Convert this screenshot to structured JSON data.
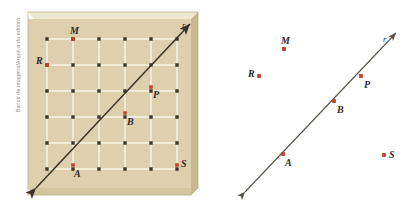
{
  "figure": {
    "credit": "Banco de imagens/Arquivo da editora",
    "colors": {
      "board_face": "#ded0ae",
      "board_top_edge": "#efe7cf",
      "board_side_edge": "#c9b98f",
      "board_outline": "#b9a87c",
      "peg": "#3c3528",
      "band": "#f7f3e6",
      "point_marker": "#c0452a",
      "line": "#3a3228",
      "label": "#2a2a2a",
      "credit_text": "#8b8b8b",
      "right_panel_bg": "#ffffff",
      "right_line": "#5a5248"
    }
  },
  "left_panel": {
    "name": "geoboard",
    "board": {
      "x": 28,
      "y": 12,
      "width": 170,
      "height": 183
    },
    "grid": {
      "columns": 6,
      "rows": 6,
      "origin_x": 47,
      "origin_y": 39,
      "spacing_x": 26,
      "spacing_y": 26
    },
    "line": {
      "label": "r",
      "label_x": 182,
      "label_y": 28,
      "x1": 36,
      "y1": 188,
      "x2": 190,
      "y2": 24,
      "arrow_start": true,
      "arrow_end": true
    },
    "points": [
      {
        "id": "M",
        "x": 73,
        "y": 39,
        "label_dx": -3,
        "label_dy": -5,
        "on_line": false
      },
      {
        "id": "R",
        "x": 47,
        "y": 65,
        "label_dx": -11,
        "label_dy": -1,
        "on_line": false
      },
      {
        "id": "P",
        "x": 151,
        "y": 87,
        "label_dx": 2,
        "label_dy": 11,
        "on_line": true
      },
      {
        "id": "B",
        "x": 125,
        "y": 113,
        "label_dx": 2,
        "label_dy": 12,
        "on_line": true
      },
      {
        "id": "A",
        "x": 73,
        "y": 165,
        "label_dx": 1,
        "label_dy": 12,
        "on_line": true
      },
      {
        "id": "S",
        "x": 177,
        "y": 165,
        "label_dx": 4,
        "label_dy": 2,
        "on_line": false
      }
    ]
  },
  "right_panel": {
    "name": "abstract-line-diagram",
    "line": {
      "label": "r",
      "label_x": 383,
      "label_y": 42,
      "x1": 245,
      "y1": 192,
      "x2": 396,
      "y2": 33,
      "arrow_start": true,
      "arrow_end": true
    },
    "points": [
      {
        "id": "M",
        "x": 284,
        "y": 49,
        "label_dx": -3,
        "label_dy": -5,
        "on_line": false
      },
      {
        "id": "R",
        "x": 259,
        "y": 76,
        "label_dx": -11,
        "label_dy": 1,
        "on_line": false
      },
      {
        "id": "P",
        "x": 361,
        "y": 76,
        "label_dx": 3,
        "label_dy": 12,
        "on_line": true
      },
      {
        "id": "B",
        "x": 334,
        "y": 101,
        "label_dx": 3,
        "label_dy": 12,
        "on_line": true
      },
      {
        "id": "A",
        "x": 283,
        "y": 154,
        "label_dx": 2,
        "label_dy": 12,
        "on_line": true
      },
      {
        "id": "S",
        "x": 384,
        "y": 155,
        "label_dx": 5,
        "label_dy": 3,
        "on_line": false
      }
    ]
  }
}
